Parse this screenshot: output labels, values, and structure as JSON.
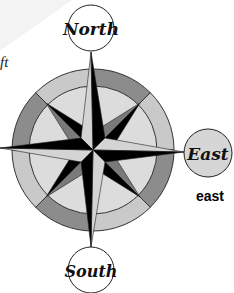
{
  "partial_text": "ft",
  "compass": {
    "north_label": "North",
    "east_label": "East",
    "south_label": "South",
    "selected": "East"
  },
  "answer_label": "east",
  "colors": {
    "ring_dark": "#8c8c8c",
    "ring_light": "#c9c9c9",
    "inner_fill": "#dcdcdc",
    "star_dark": "#000000",
    "star_light": "#d4d4d4",
    "star_mid": "#7a7a7a",
    "selected_fill": "#d6d6d6"
  }
}
